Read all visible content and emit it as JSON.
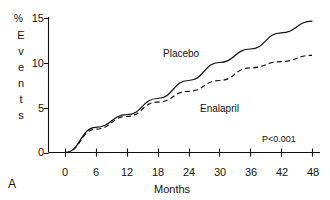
{
  "panel": {
    "letter": "A"
  },
  "chart_data": {
    "type": "line",
    "title": "",
    "xlabel": "Months",
    "ylabel": "% Events",
    "ylabel_unit": "%",
    "ylabel_word": "Events",
    "ylabel_letters": [
      "E",
      "v",
      "e",
      "n",
      "t",
      "s"
    ],
    "x": [
      0,
      6,
      12,
      18,
      24,
      30,
      36,
      42,
      48
    ],
    "xticks": [
      "0",
      "6",
      "12",
      "18",
      "24",
      "30",
      "36",
      "42",
      "48"
    ],
    "yticks": [
      "0",
      "5",
      "10",
      "15"
    ],
    "xlim": [
      0,
      48
    ],
    "ylim": [
      0,
      15
    ],
    "grid": false,
    "legend": "inline-labels",
    "annotation": "P<0.001",
    "series": [
      {
        "name": "Placebo",
        "style": "solid",
        "color": "#111111",
        "values": [
          0,
          2.8,
          4.2,
          6.0,
          8.0,
          10.0,
          11.5,
          13.3,
          14.6
        ]
      },
      {
        "name": "Enalapril",
        "style": "dashed",
        "color": "#111111",
        "values": [
          0,
          2.6,
          4.0,
          5.6,
          6.8,
          8.0,
          9.4,
          10.1,
          10.8
        ]
      }
    ]
  }
}
